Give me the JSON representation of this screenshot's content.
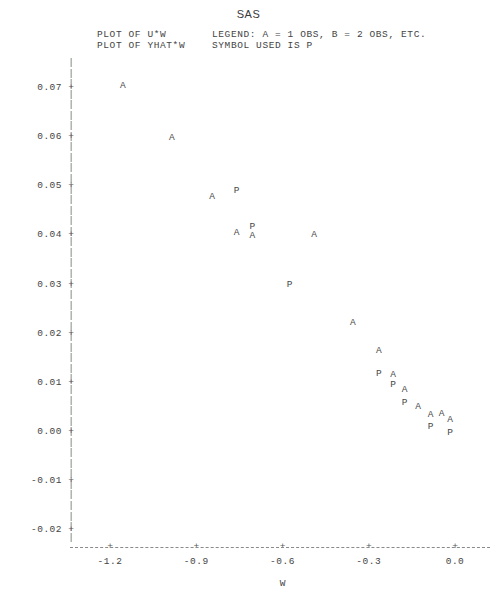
{
  "title": "SAS",
  "header": {
    "left_lines": "PLOT OF U*W\nPLOT OF YHAT*W",
    "right_lines": "LEGEND: A = 1 OBS, B = 2 OBS, ETC.\nSYMBOL USED IS P"
  },
  "axes": {
    "y_label": "PREDICTED\n\nVALUE",
    "x_label": "W",
    "y_ticks": [
      "0.07",
      "0.06",
      "0.05",
      "0.04",
      "0.03",
      "0.02",
      "0.01",
      "0.00",
      "-0.01",
      "-0.02"
    ],
    "y_tick_values": [
      0.07,
      0.06,
      0.05,
      0.04,
      0.03,
      0.02,
      0.01,
      0.0,
      -0.01,
      -0.02
    ],
    "x_ticks": [
      "-1.2",
      "-0.9",
      "-0.6",
      "-0.3",
      "0.0"
    ],
    "x_tick_values": [
      -1.2,
      -0.9,
      -0.6,
      -0.3,
      0.0
    ],
    "y_range": [
      -0.025,
      0.0755
    ],
    "x_range": [
      -1.29,
      0.06
    ],
    "tick_marker": "+",
    "axis_glyph": "|"
  },
  "chart_data": {
    "type": "scatter",
    "title": "SAS",
    "xlabel": "W",
    "ylabel": "PREDICTED VALUE",
    "xlim": [
      -1.29,
      0.06
    ],
    "ylim": [
      -0.025,
      0.0755
    ],
    "grid": false,
    "legend": "LEGEND: A = 1 OBS, B = 2 OBS, ETC.",
    "series": [
      {
        "name": "U*W",
        "symbol": "A",
        "points": [
          {
            "x": -1.155,
            "y": 0.0705
          },
          {
            "x": -0.985,
            "y": 0.0598
          },
          {
            "x": -0.845,
            "y": 0.0478
          },
          {
            "x": -0.76,
            "y": 0.0405
          },
          {
            "x": -0.705,
            "y": 0.0398
          },
          {
            "x": -0.49,
            "y": 0.04
          },
          {
            "x": -0.355,
            "y": 0.0222
          },
          {
            "x": -0.265,
            "y": 0.0164
          },
          {
            "x": -0.215,
            "y": 0.0115
          },
          {
            "x": -0.175,
            "y": 0.0085
          },
          {
            "x": -0.128,
            "y": 0.005
          },
          {
            "x": -0.085,
            "y": 0.0035
          },
          {
            "x": -0.047,
            "y": 0.0037
          },
          {
            "x": -0.017,
            "y": 0.0025
          }
        ]
      },
      {
        "name": "YHAT*W",
        "symbol": "P",
        "points": [
          {
            "x": -0.76,
            "y": 0.049
          },
          {
            "x": -0.705,
            "y": 0.0418
          },
          {
            "x": -0.575,
            "y": 0.03
          },
          {
            "x": -0.265,
            "y": 0.0118
          },
          {
            "x": -0.215,
            "y": 0.0095
          },
          {
            "x": -0.175,
            "y": 0.006
          },
          {
            "x": -0.085,
            "y": 0.001
          },
          {
            "x": -0.017,
            "y": -0.0002
          }
        ]
      }
    ]
  }
}
